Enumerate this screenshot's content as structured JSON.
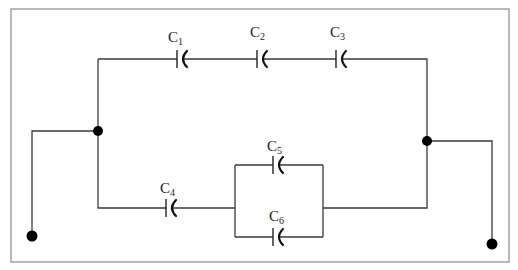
{
  "diagram": {
    "type": "capacitor-circuit",
    "colors": {
      "wire": "#3a3a3a",
      "frame": "#8a8a8a",
      "node": "#000000",
      "text": "#222222"
    },
    "frame": {
      "x": 11,
      "y": 9,
      "w": 498,
      "h": 253
    },
    "wires": [
      {
        "id": "top-left-vertical",
        "points": [
          [
            98,
            59
          ],
          [
            98,
            131
          ]
        ]
      },
      {
        "id": "top-branch",
        "points": [
          [
            98,
            59
          ],
          [
            177,
            59
          ]
        ]
      },
      {
        "id": "c1-c2",
        "points": [
          [
            182,
            59
          ],
          [
            257,
            59
          ]
        ]
      },
      {
        "id": "c2-c3",
        "points": [
          [
            262,
            59
          ],
          [
            336,
            59
          ]
        ]
      },
      {
        "id": "c3-right",
        "points": [
          [
            341,
            59
          ],
          [
            427,
            59
          ],
          [
            427,
            141
          ]
        ]
      },
      {
        "id": "left-terminal-lead",
        "points": [
          [
            98,
            131
          ],
          [
            32,
            131
          ],
          [
            32,
            236
          ]
        ]
      },
      {
        "id": "bottom-left",
        "points": [
          [
            98,
            131
          ],
          [
            98,
            208
          ],
          [
            166,
            208
          ]
        ]
      },
      {
        "id": "c4-parallel",
        "points": [
          [
            171,
            208
          ],
          [
            235,
            208
          ]
        ]
      },
      {
        "id": "parallel-left",
        "points": [
          [
            235,
            165
          ],
          [
            235,
            237
          ]
        ]
      },
      {
        "id": "parallel-top-a",
        "points": [
          [
            235,
            165
          ],
          [
            273,
            165
          ]
        ]
      },
      {
        "id": "parallel-top-b",
        "points": [
          [
            278,
            165
          ],
          [
            323,
            165
          ]
        ]
      },
      {
        "id": "parallel-bottom-a",
        "points": [
          [
            235,
            237
          ],
          [
            273,
            237
          ]
        ]
      },
      {
        "id": "parallel-bottom-b",
        "points": [
          [
            278,
            237
          ],
          [
            323,
            237
          ]
        ]
      },
      {
        "id": "parallel-right",
        "points": [
          [
            323,
            165
          ],
          [
            323,
            237
          ]
        ]
      },
      {
        "id": "parallel-out",
        "points": [
          [
            323,
            208
          ],
          [
            427,
            208
          ],
          [
            427,
            141
          ]
        ]
      },
      {
        "id": "right-terminal-lead",
        "points": [
          [
            427,
            141
          ],
          [
            492,
            141
          ],
          [
            492,
            244
          ]
        ]
      }
    ],
    "capacitors": [
      {
        "name": "C",
        "sub": "1",
        "x": 177,
        "y": 59,
        "label_x": 168,
        "label_y": 42
      },
      {
        "name": "C",
        "sub": "2",
        "x": 257,
        "y": 59,
        "label_x": 250,
        "label_y": 37
      },
      {
        "name": "C",
        "sub": "3",
        "x": 336,
        "y": 59,
        "label_x": 330,
        "label_y": 37
      },
      {
        "name": "C",
        "sub": "4",
        "x": 166,
        "y": 208,
        "label_x": 160,
        "label_y": 193
      },
      {
        "name": "C",
        "sub": "5",
        "x": 273,
        "y": 165,
        "label_x": 267,
        "label_y": 151
      },
      {
        "name": "C",
        "sub": "6",
        "x": 273,
        "y": 237,
        "label_x": 269,
        "label_y": 221
      }
    ],
    "nodes": [
      {
        "id": "left-junction",
        "x": 98,
        "y": 131,
        "r": 5
      },
      {
        "id": "right-junction",
        "x": 427,
        "y": 141,
        "r": 5
      },
      {
        "id": "left-terminal",
        "x": 32,
        "y": 236,
        "r": 5.5
      },
      {
        "id": "right-terminal",
        "x": 492,
        "y": 244,
        "r": 5.5
      }
    ]
  }
}
